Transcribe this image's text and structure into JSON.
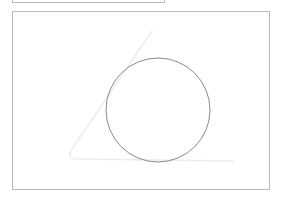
{
  "top_panel": {
    "visible": true
  },
  "canvas": {
    "background": "#ffffff",
    "border_color": "#b9b9b9",
    "shapes": [
      {
        "type": "triangle",
        "style": "faint",
        "stroke": "#ececec",
        "points": [
          [
            152,
            31
          ],
          [
            68,
            155
          ],
          [
            233,
            161
          ]
        ]
      },
      {
        "type": "circle",
        "stroke": "#8a8a8a",
        "cx": 158,
        "cy": 110,
        "r": 52
      }
    ]
  }
}
